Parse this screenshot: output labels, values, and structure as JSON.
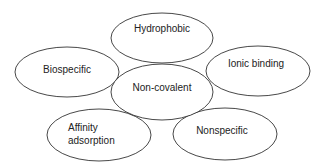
{
  "diagram": {
    "center": {
      "label": "Non-covalent"
    },
    "nodes": [
      {
        "id": "hydrophobic",
        "label": "Hydrophobic"
      },
      {
        "id": "biospecific",
        "label": "Biospecific"
      },
      {
        "id": "ionic-binding",
        "label": "Ionic binding"
      },
      {
        "id": "affinity-adsorption",
        "label_line1": "Affinity",
        "label_line2": "adsorption"
      },
      {
        "id": "nonspecific",
        "label": "Nonspecific"
      }
    ]
  },
  "colors": {
    "stroke": "#333333",
    "fill": "#ffffff",
    "text": "#222222"
  }
}
